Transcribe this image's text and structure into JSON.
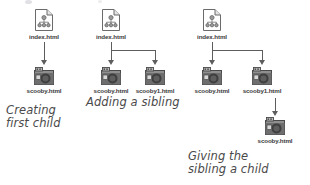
{
  "diagram": {
    "colors": {
      "connector": "#5d5d5d",
      "label_text": "#3a3a3a",
      "caption_text": "#4a4a4a",
      "page_icon_fill": "#ffffff",
      "page_icon_stroke": "#6b6b6b",
      "tree_glyph": "#8c8c8c",
      "media_icon_dark": "#4f4f4f",
      "media_icon_light": "#9a9a9a",
      "background": "#ffffff"
    },
    "groups": [
      {
        "id": "group-creating-first-child",
        "caption": "Creating\nfirst child",
        "nodes": [
          {
            "id": "g1-root",
            "label": "index.html",
            "icon": "html-page-icon"
          },
          {
            "id": "g1-child",
            "label": "scooby.html",
            "icon": "media-file-icon"
          }
        ],
        "edges": [
          {
            "from": "g1-root",
            "to": "g1-child",
            "style": "straight-arrow-down"
          }
        ]
      },
      {
        "id": "group-adding-a-sibling",
        "caption": "Adding a sibling",
        "nodes": [
          {
            "id": "g2-root",
            "label": "index.html",
            "icon": "html-page-icon"
          },
          {
            "id": "g2-child-1",
            "label": "scooby.html",
            "icon": "media-file-icon"
          },
          {
            "id": "g2-child-2",
            "label": "scooby1.html",
            "icon": "media-file-icon"
          }
        ],
        "edges": [
          {
            "from": "g2-root",
            "to": "g2-child-1",
            "style": "branch-arrow-down"
          },
          {
            "from": "g2-root",
            "to": "g2-child-2",
            "style": "branch-arrow-down"
          }
        ]
      },
      {
        "id": "group-giving-the-sibling-a-child",
        "caption": "Giving the\nsibling a child",
        "nodes": [
          {
            "id": "g3-root",
            "label": "index.html",
            "icon": "html-page-icon"
          },
          {
            "id": "g3-child-1",
            "label": "scooby.html",
            "icon": "media-file-icon"
          },
          {
            "id": "g3-child-2",
            "label": "scooby1.html",
            "icon": "media-file-icon"
          },
          {
            "id": "g3-grandchild",
            "label": "scooby.html",
            "icon": "media-file-icon"
          }
        ],
        "edges": [
          {
            "from": "g3-root",
            "to": "g3-child-1",
            "style": "branch-arrow-down"
          },
          {
            "from": "g3-root",
            "to": "g3-child-2",
            "style": "branch-arrow-down"
          },
          {
            "from": "g3-child-2",
            "to": "g3-grandchild",
            "style": "straight-arrow-down"
          }
        ]
      }
    ]
  }
}
